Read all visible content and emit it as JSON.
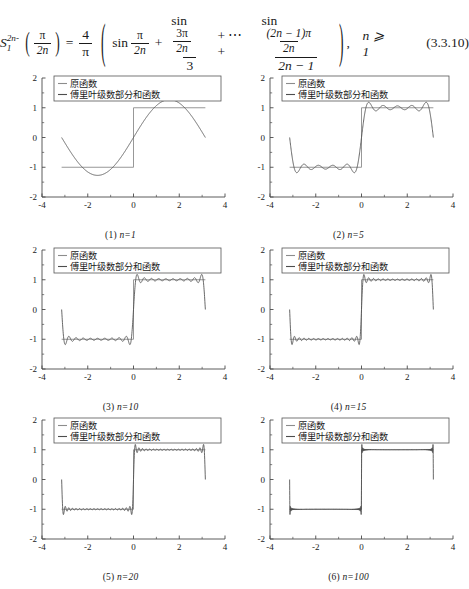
{
  "equation": {
    "lhs_symbol": "S",
    "lhs_sub": "2n-1",
    "lhs_arg_num": "π",
    "lhs_arg_den": "2n",
    "equals": "=",
    "coef_num": "4",
    "coef_den": "π",
    "term1_op": "sin",
    "term1_num": "π",
    "term1_den": "2n",
    "plus1": "+",
    "term2_op": "sin",
    "term2_num_inner_num": "3π",
    "term2_num_inner_den": "2n",
    "term2_den": "3",
    "ellipsis": "+ ⋯ +",
    "term3_op": "sin",
    "term3_num_inner_num": "(2n − 1)π",
    "term3_num_inner_den": "2n",
    "term3_den": "2n − 1",
    "comma": ",",
    "condition": "n ⩾ 1",
    "tag": "(3.3.10)"
  },
  "legend": {
    "series1_label": "原函数",
    "series2_label": "傅里叶级数部分和函数"
  },
  "axes": {
    "x_ticks": [
      "-4",
      "-2",
      "0",
      "2",
      "4"
    ],
    "y_ticks": [
      "-2",
      "-1",
      "0",
      "1",
      "2"
    ],
    "xlim": [
      -4,
      4
    ],
    "ylim": [
      -2,
      2
    ]
  },
  "chart_data": [
    {
      "type": "line",
      "title": "(1) n=1",
      "caption_index": "(1)",
      "caption_param": "n=1",
      "n": 1,
      "xlabel": "",
      "ylabel": "",
      "xlim": [
        -4,
        4
      ],
      "ylim": [
        -2,
        2
      ],
      "x_ticks": [
        -4,
        -2,
        0,
        2,
        4
      ],
      "y_ticks": [
        -2,
        -1,
        0,
        1,
        2
      ],
      "grid": false,
      "legend_position": "upper-center",
      "series": [
        {
          "name": "原函数",
          "description": "square wave: -1 on [-pi,0), +1 on (0,pi]",
          "color": "#8c8c8c",
          "kind": "square-wave",
          "amplitude": 1,
          "domain": [
            -3.1416,
            3.1416
          ]
        },
        {
          "name": "傅里叶级数部分和函数",
          "description": "partial sum of Fourier sine series with 1 term",
          "color": "#4d4d4d",
          "kind": "fourier-partial-sum",
          "terms": 1,
          "peak_overshoot": 1.27,
          "domain": [
            -3.1416,
            3.1416
          ]
        }
      ]
    },
    {
      "type": "line",
      "title": "(2) n=5",
      "caption_index": "(2)",
      "caption_param": "n=5",
      "n": 5,
      "xlabel": "",
      "ylabel": "",
      "xlim": [
        -4,
        4
      ],
      "ylim": [
        -2,
        2
      ],
      "x_ticks": [
        -4,
        -2,
        0,
        2,
        4
      ],
      "y_ticks": [
        -2,
        -1,
        0,
        1,
        2
      ],
      "grid": false,
      "legend_position": "upper-center",
      "series": [
        {
          "name": "原函数",
          "description": "square wave: -1 on [-pi,0), +1 on (0,pi]",
          "color": "#8c8c8c",
          "kind": "square-wave",
          "amplitude": 1,
          "domain": [
            -3.1416,
            3.1416
          ]
        },
        {
          "name": "傅里叶级数部分和函数",
          "description": "partial sum of Fourier sine series with 5 terms",
          "color": "#4d4d4d",
          "kind": "fourier-partial-sum",
          "terms": 5,
          "peak_overshoot": 1.18,
          "domain": [
            -3.1416,
            3.1416
          ]
        }
      ]
    },
    {
      "type": "line",
      "title": "(3) n=10",
      "caption_index": "(3)",
      "caption_param": "n=10",
      "n": 10,
      "xlabel": "",
      "ylabel": "",
      "xlim": [
        -4,
        4
      ],
      "ylim": [
        -2,
        2
      ],
      "x_ticks": [
        -4,
        -2,
        0,
        2,
        4
      ],
      "y_ticks": [
        -2,
        -1,
        0,
        1,
        2
      ],
      "grid": false,
      "legend_position": "upper-center",
      "series": [
        {
          "name": "原函数",
          "description": "square wave: -1 on [-pi,0), +1 on (0,pi]",
          "color": "#8c8c8c",
          "kind": "square-wave",
          "amplitude": 1,
          "domain": [
            -3.1416,
            3.1416
          ]
        },
        {
          "name": "傅里叶级数部分和函数",
          "description": "partial sum of Fourier sine series with 10 terms",
          "color": "#4d4d4d",
          "kind": "fourier-partial-sum",
          "terms": 10,
          "peak_overshoot": 1.17,
          "domain": [
            -3.1416,
            3.1416
          ]
        }
      ]
    },
    {
      "type": "line",
      "title": "(4) n=15",
      "caption_index": "(4)",
      "caption_param": "n=15",
      "n": 15,
      "xlabel": "",
      "ylabel": "",
      "xlim": [
        -4,
        4
      ],
      "ylim": [
        -2,
        2
      ],
      "x_ticks": [
        -4,
        -2,
        0,
        2,
        4
      ],
      "y_ticks": [
        -2,
        -1,
        0,
        1,
        2
      ],
      "grid": false,
      "legend_position": "upper-center",
      "series": [
        {
          "name": "原函数",
          "description": "square wave: -1 on [-pi,0), +1 on (0,pi]",
          "color": "#8c8c8c",
          "kind": "square-wave",
          "amplitude": 1,
          "domain": [
            -3.1416,
            3.1416
          ]
        },
        {
          "name": "傅里叶级数部分和函数",
          "description": "partial sum of Fourier sine series with 15 terms",
          "color": "#4d4d4d",
          "kind": "fourier-partial-sum",
          "terms": 15,
          "peak_overshoot": 1.17,
          "domain": [
            -3.1416,
            3.1416
          ]
        }
      ]
    },
    {
      "type": "line",
      "title": "(5) n=20",
      "caption_index": "(5)",
      "caption_param": "n=20",
      "n": 20,
      "xlabel": "",
      "ylabel": "",
      "xlim": [
        -4,
        4
      ],
      "ylim": [
        -2,
        2
      ],
      "x_ticks": [
        -4,
        -2,
        0,
        2,
        4
      ],
      "y_ticks": [
        -2,
        -1,
        0,
        1,
        2
      ],
      "grid": false,
      "legend_position": "upper-center",
      "series": [
        {
          "name": "原函数",
          "description": "square wave: -1 on [-pi,0), +1 on (0,pi]",
          "color": "#8c8c8c",
          "kind": "square-wave",
          "amplitude": 1,
          "domain": [
            -3.1416,
            3.1416
          ]
        },
        {
          "name": "傅里叶级数部分和函数",
          "description": "partial sum of Fourier sine series with 20 terms",
          "color": "#4d4d4d",
          "kind": "fourier-partial-sum",
          "terms": 20,
          "peak_overshoot": 1.17,
          "domain": [
            -3.1416,
            3.1416
          ]
        }
      ]
    },
    {
      "type": "line",
      "title": "(6) n=100",
      "caption_index": "(6)",
      "caption_param": "n=100",
      "n": 100,
      "xlabel": "",
      "ylabel": "",
      "xlim": [
        -4,
        4
      ],
      "ylim": [
        -2,
        2
      ],
      "x_ticks": [
        -4,
        -2,
        0,
        2,
        4
      ],
      "y_ticks": [
        -2,
        -1,
        0,
        1,
        2
      ],
      "grid": false,
      "legend_position": "upper-center",
      "series": [
        {
          "name": "原函数",
          "description": "square wave: -1 on [-pi,0), +1 on (0,pi]",
          "color": "#8c8c8c",
          "kind": "square-wave",
          "amplitude": 1,
          "domain": [
            -3.1416,
            3.1416
          ]
        },
        {
          "name": "傅里叶级数部分和函数",
          "description": "partial sum of Fourier sine series with 100 terms",
          "color": "#4d4d4d",
          "kind": "fourier-partial-sum",
          "terms": 100,
          "peak_overshoot": 1.17,
          "domain": [
            -3.1416,
            3.1416
          ]
        }
      ]
    }
  ],
  "colors": {
    "original_function": "#8c8c8c",
    "partial_sum": "#4d4d4d",
    "axis": "#4a4a4a",
    "text": "#1a1a1a",
    "legend_border": "#555555",
    "page_background": "#ffffff"
  }
}
